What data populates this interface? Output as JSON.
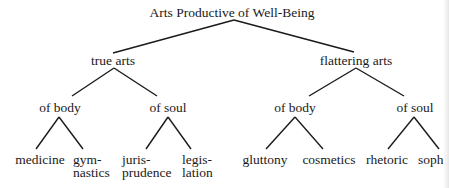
{
  "diagram": {
    "type": "tree",
    "root": {
      "label": "Arts Productive of Well-Being",
      "children": [
        {
          "label": "true arts",
          "children": [
            {
              "label": "of body",
              "children": [
                {
                  "label": "medicine"
                },
                {
                  "label": "gym-\nnastics",
                  "line1": "gym-",
                  "line2": "nastics"
                }
              ]
            },
            {
              "label": "of soul",
              "children": [
                {
                  "label": "juris-\nprudence",
                  "line1": "juris-",
                  "line2": "prudence"
                },
                {
                  "label": "legis-\nlation",
                  "line1": "legis-",
                  "line2": "lation"
                }
              ]
            }
          ]
        },
        {
          "label": "flattering arts",
          "children": [
            {
              "label": "of body",
              "children": [
                {
                  "label": "gluttony"
                },
                {
                  "label": "cosmetics"
                }
              ]
            },
            {
              "label": "of soul",
              "children": [
                {
                  "label": "rhetoric"
                },
                {
                  "label": "soph"
                }
              ]
            }
          ]
        }
      ]
    }
  },
  "nodes": {
    "root": "Arts Productive of Well-Being",
    "true_arts": "true arts",
    "flattering_arts": "flattering arts",
    "true_body": "of body",
    "true_soul": "of soul",
    "flat_body": "of body",
    "flat_soul": "of soul",
    "medicine": "medicine",
    "gymnastics_1": "gym-",
    "gymnastics_2": "nastics",
    "jurisprudence_1": "juris-",
    "jurisprudence_2": "prudence",
    "legislation_1": "legis-",
    "legislation_2": "lation",
    "gluttony": "gluttony",
    "cosmetics": "cosmetics",
    "rhetoric": "rhetoric",
    "soph": "soph"
  },
  "colors": {
    "ink": "#1a1a1a",
    "background": "#ffffff"
  }
}
